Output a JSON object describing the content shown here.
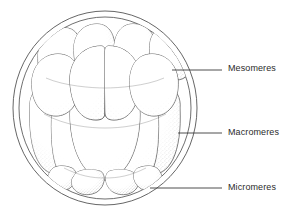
{
  "figure": {
    "kind": "biological-line-diagram",
    "background_color": "#ffffff",
    "ink_color": "#3a3a3a",
    "text_color": "#2b2b2b",
    "stipple_color": "#8a8a8a"
  },
  "labels": [
    {
      "id": "mesomeres",
      "text": "Mesomeres",
      "leader": {
        "x1": 172,
        "y1": 70,
        "x2": 222,
        "y2": 70
      }
    },
    {
      "id": "macromeres",
      "text": "Macromeres",
      "leader": {
        "x1": 178,
        "y1": 133,
        "x2": 222,
        "y2": 133
      }
    },
    {
      "id": "micromeres",
      "text": "Micromeres",
      "leader": {
        "x1": 150,
        "y1": 188,
        "x2": 222,
        "y2": 188
      }
    }
  ],
  "envelope": {
    "name": "fertilization-envelope",
    "outer": {
      "cx": 105,
      "cy": 108,
      "rx": 92,
      "ry": 97
    },
    "inner": {
      "cx": 105,
      "cy": 108,
      "rx": 86,
      "ry": 91
    }
  },
  "cells": {
    "mesomeres_count": 8,
    "macromeres_count": 4,
    "micromeres_count": 4,
    "total": 16
  }
}
